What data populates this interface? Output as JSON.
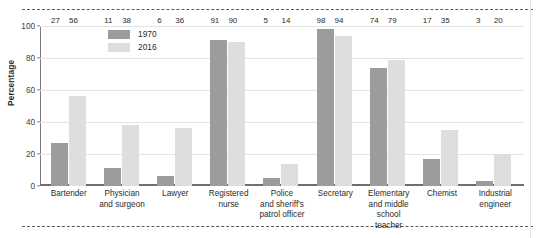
{
  "chart_data": {
    "type": "bar",
    "title": "",
    "subtitle": "",
    "xlabel": "",
    "ylabel": "Percentage",
    "ylim": [
      0,
      100
    ],
    "yticks": [
      0,
      20,
      40,
      60,
      80,
      100
    ],
    "grid": true,
    "legend_position": "top-left-inside",
    "categories": [
      "Bartender",
      "Physician and surgeon",
      "Lawyer",
      "Registered nurse",
      "Police and sheriff's patrol officer",
      "Secretary",
      "Elementary and middle school teacher",
      "Chemist",
      "Industrial engineer"
    ],
    "category_lines": [
      [
        "Bartender"
      ],
      [
        "Physician",
        "and surgeon"
      ],
      [
        "Lawyer"
      ],
      [
        "Registered",
        "nurse"
      ],
      [
        "Police",
        "and sheriff's",
        "patrol officer"
      ],
      [
        "Secretary"
      ],
      [
        "Elementary",
        "and middle",
        "school teacher"
      ],
      [
        "Chemist"
      ],
      [
        "Industrial",
        "engineer"
      ]
    ],
    "series": [
      {
        "name": "1970",
        "color": "#9c9c9c",
        "values": [
          27,
          11,
          6,
          91,
          5,
          98,
          74,
          17,
          3
        ]
      },
      {
        "name": "2016",
        "color": "#dedede",
        "values": [
          56,
          38,
          36,
          90,
          14,
          94,
          79,
          35,
          20
        ]
      }
    ]
  },
  "legend": {
    "items": [
      {
        "label": "1970"
      },
      {
        "label": "2016"
      }
    ]
  },
  "axis": {
    "y_title": "Percentage",
    "y_tick_labels": [
      "100",
      "80",
      "60",
      "40",
      "20",
      "0"
    ]
  }
}
